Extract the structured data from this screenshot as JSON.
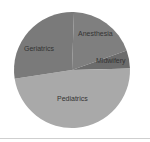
{
  "chart_data": {
    "type": "pie",
    "title": "",
    "categories": [
      "Anesthesia",
      "Midwifery",
      "Pediatrics",
      "Geriatrics"
    ],
    "values": [
      19,
      5,
      48,
      28
    ],
    "unit": "percent (estimated)",
    "start_angle_deg": 2,
    "direction": "clockwise",
    "legend": "none (labels placed inside slices)",
    "colors": [
      "#7f7f7f",
      "#6c6c6c",
      "#a9a9a9",
      "#7a7a7a"
    ],
    "labels": [
      {
        "text": "Anesthesia",
        "x": 78,
        "y": 36
      },
      {
        "text": "Midwifery",
        "x": 96,
        "y": 63
      },
      {
        "text": "Pediatrics",
        "x": 57,
        "y": 101
      },
      {
        "text": "Geriatrics",
        "x": 24,
        "y": 51
      }
    ]
  },
  "layout": {
    "center": [
      72,
      70
    ],
    "radius": 58,
    "background": "#ffffff",
    "rule_color": "#cfcfcf"
  }
}
